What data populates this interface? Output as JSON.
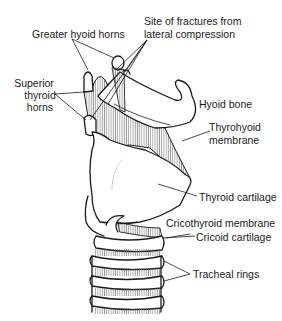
{
  "figure": {
    "labels": {
      "greater_hyoid_horns": "Greater hyoid horns",
      "fracture_site_line1": "Site of fractures from",
      "fracture_site_line2": "lateral compression",
      "superior_thyroid_horns_line1": "Superior",
      "superior_thyroid_horns_line2": "thyroid",
      "superior_thyroid_horns_line3": "horns",
      "hyoid_bone": "Hyoid bone",
      "thyrohyoid_membrane_line1": "Thyrohyoid",
      "thyrohyoid_membrane_line2": "membrane",
      "thyroid_cartilage": "Thyroid cartilage",
      "cricothyroid_membrane": "Cricothyroid membrane",
      "cricoid_cartilage": "Cricoid cartilage",
      "tracheal_rings": "Tracheal rings"
    },
    "colors": {
      "line": "#1a1a1a",
      "background": "#ffffff",
      "hatch": "#555555"
    }
  }
}
